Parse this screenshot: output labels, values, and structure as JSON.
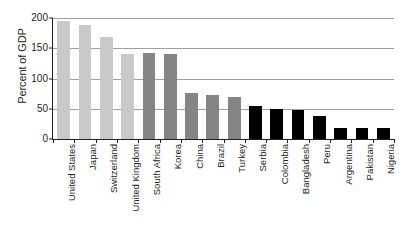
{
  "chart_data": {
    "type": "bar",
    "title": "",
    "xlabel": "",
    "ylabel": "Percent of GDP",
    "ylim": [
      0,
      200
    ],
    "yticks": [
      0,
      50,
      100,
      150,
      200
    ],
    "ytick_labels": [
      "0",
      "50",
      "100",
      "150",
      "200"
    ],
    "grid": true,
    "legend": "none",
    "categories": [
      "United States",
      "Japan",
      "Switzerland",
      "United Kingdom",
      "South Africa",
      "Korea",
      "China",
      "Brazil",
      "Turkey",
      "Serbia",
      "Colombia",
      "Bangladesh",
      "Peru",
      "Argentina",
      "Pakistan",
      "Nigeria"
    ],
    "values": [
      195,
      189,
      168,
      141,
      142,
      140,
      76,
      72,
      70,
      55,
      50,
      48,
      38,
      19,
      18,
      18
    ],
    "bar_colors": [
      "#c9c9c9",
      "#c9c9c9",
      "#c9c9c9",
      "#c9c9c9",
      "#858585",
      "#858585",
      "#858585",
      "#858585",
      "#858585",
      "#000000",
      "#000000",
      "#000000",
      "#000000",
      "#000000",
      "#000000",
      "#000000"
    ],
    "colors": {
      "group_light": "#c9c9c9",
      "group_medium": "#858585",
      "group_dark": "#000000",
      "axis": "#231f20",
      "gridline": "#9d9fa2",
      "background": "#ffffff"
    }
  }
}
